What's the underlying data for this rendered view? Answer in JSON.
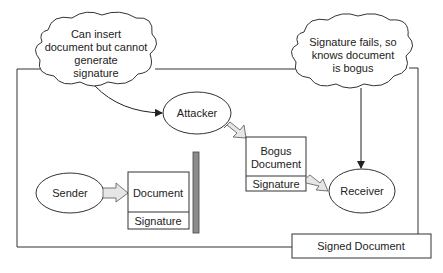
{
  "diagram": {
    "cloud_attacker_note": {
      "lines": [
        "Can insert",
        "document but cannot",
        "generate",
        "signature"
      ]
    },
    "cloud_receiver_note": {
      "lines": [
        "Signature fails, so",
        "knows document",
        "is bogus"
      ]
    },
    "attacker": {
      "label": "Attacker"
    },
    "sender": {
      "label": "Sender"
    },
    "receiver": {
      "label": "Receiver"
    },
    "document": {
      "body": "Document",
      "signature": "Signature"
    },
    "bogus_document": {
      "body_lines": [
        "Bogus",
        "Document"
      ],
      "signature": "Signature"
    },
    "signed_document_box": {
      "label": "Signed Document"
    },
    "colors": {
      "stroke": "#333333",
      "block_arrow_fill": "#e6e6e6",
      "barrier_fill": "#8c8c8c"
    }
  }
}
